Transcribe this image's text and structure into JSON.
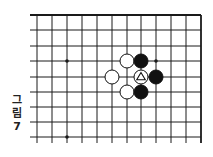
{
  "figure": {
    "caption_chars": [
      "그",
      "림",
      "7"
    ],
    "caption": "그림 7"
  },
  "board": {
    "columns_x": [
      37,
      52,
      67,
      82,
      97,
      112,
      127,
      141,
      156,
      171,
      186,
      201
    ],
    "rows_y": [
      15,
      30,
      46,
      61,
      77,
      92,
      107,
      122,
      137
    ],
    "edges": [
      "top",
      "right"
    ],
    "line_color": "#1a1a1a",
    "star_points": [
      {
        "col": 2,
        "row": 3
      },
      {
        "col": 8,
        "row": 3
      },
      {
        "col": 2,
        "row": 8
      }
    ],
    "stones": [
      {
        "color": "white",
        "col": 6,
        "row": 3
      },
      {
        "color": "white",
        "col": 5,
        "row": 4
      },
      {
        "color": "white",
        "col": 6,
        "row": 5
      },
      {
        "color": "white",
        "col": 7,
        "row": 4,
        "marker": "triangle"
      },
      {
        "color": "black",
        "col": 7,
        "row": 3
      },
      {
        "color": "black",
        "col": 8,
        "row": 4
      },
      {
        "color": "black",
        "col": 7,
        "row": 5
      }
    ],
    "stone_radius": 7
  }
}
